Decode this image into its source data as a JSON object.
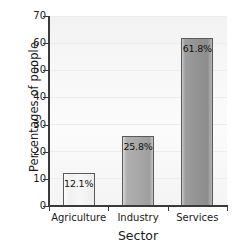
{
  "chart_data": {
    "type": "bar",
    "title": "",
    "xlabel": "Sector",
    "ylabel": "Percentages of people",
    "categories": [
      "Agriculture",
      "Industry",
      "Services"
    ],
    "values": [
      12.1,
      25.8,
      61.8
    ],
    "data_labels": [
      "12.1%",
      "25.8%",
      "61.8%"
    ],
    "ylim": [
      0,
      70
    ],
    "yticks": [
      0,
      10,
      20,
      30,
      40,
      50,
      60,
      70
    ],
    "ytick_labels": [
      "0",
      "10",
      "20",
      "30",
      "40",
      "50",
      "60",
      "70"
    ],
    "grid": true,
    "legend": "none",
    "bar_styles": [
      "light",
      "mid",
      "dark"
    ],
    "colors": {
      "bar_outline": "#5a5a5a",
      "bar_light": "#f5f5f5",
      "bar_mid": "#a6a6a6",
      "bar_dark": "#949494",
      "axis": "#3a3a3a",
      "text": "#1a1a1a",
      "plot_background": "#f7f7f7",
      "page_background": "#ffffff"
    }
  }
}
